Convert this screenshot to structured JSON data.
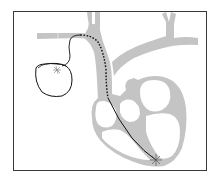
{
  "diagram": {
    "title": "Pacemaker with transvenous lead",
    "colors": {
      "background": "#ffffff",
      "frame": "#3a3a3a",
      "vessels": "#c4c4c4",
      "heart_wall": "#c4c4c4",
      "chamber": "#ffffff",
      "lead": "#111111",
      "pacemaker_outline": "#111111",
      "electrode_tip": "#555555"
    },
    "elements": [
      {
        "id": "pacemaker",
        "label": "Pacemaker generator"
      },
      {
        "id": "lead-subcutaneous",
        "label": "Lead (solid, under skin)"
      },
      {
        "id": "lead-intravenous",
        "label": "Lead (dotted, inside vein)"
      },
      {
        "id": "lead-intracardiac",
        "label": "Lead (solid, inside heart)"
      },
      {
        "id": "electrode-tip",
        "label": "Electrode tip at right ventricular apex"
      },
      {
        "id": "subclavian-vein",
        "label": "Subclavian vein"
      },
      {
        "id": "superior-vena-cava",
        "label": "Superior vena cava"
      },
      {
        "id": "aortic-arch",
        "label": "Aortic arch"
      },
      {
        "id": "heart",
        "label": "Heart"
      }
    ]
  }
}
